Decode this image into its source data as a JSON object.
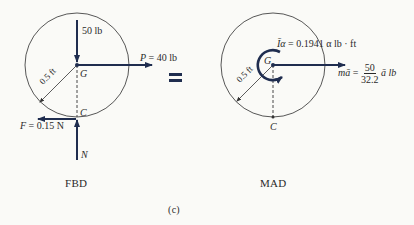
{
  "colors": {
    "arrow": "#1f2d4f",
    "line": "#333333",
    "background": "#fafaf7"
  },
  "fbd": {
    "weight_label": "50 lb",
    "p_symbol": "P",
    "p_value": "= 40 lb",
    "center_label": "G",
    "contact_label": "C",
    "radius_label": "0.5 ft",
    "friction_symbol": "F",
    "friction_value": "= 0.15 N",
    "normal_label": "N",
    "caption": "FBD"
  },
  "equals_sign": "=",
  "mad": {
    "moment_symbol": "Īα",
    "moment_value": "= 0.1941 α lb · ft",
    "center_label": "G",
    "contact_label": "C",
    "radius_label": "0.5 ft",
    "force_symbol": "mā",
    "force_eq": "=",
    "frac_num": "50",
    "frac_den": "32.2",
    "force_tail": "ā lb",
    "caption": "MAD"
  },
  "figure_label": "(c)"
}
